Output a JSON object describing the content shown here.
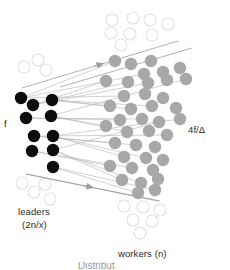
{
  "figure": {
    "labels": {
      "left_node_label": "f",
      "right_node_label": "4f/Δ",
      "leaders_label": "leaders",
      "leaders_sublabel": "(2n/x)",
      "workers_label": "workers (n)",
      "caption_partial": "Distribut"
    },
    "colors": {
      "leader_fill": "#0d0d0d",
      "worker_fill": "#a8a8a8",
      "ghost_stroke": "#e2e2e2",
      "edge_stroke": "#b4b4b4",
      "arrow_stroke": "#a0a0a0",
      "text": "#2b2b2b",
      "background": "#ffffff"
    }
  },
  "chart_data": {
    "type": "scatter",
    "xlabel": "",
    "ylabel": "",
    "xlim": [
      0,
      230
    ],
    "ylim": [
      0,
      270
    ],
    "grid": false,
    "legend": "none",
    "annotations": [
      {
        "text": "f",
        "x": 6,
        "y": 123
      },
      {
        "text": "4f/Δ",
        "x": 190,
        "y": 130
      },
      {
        "text": "leaders",
        "x": 20,
        "y": 212
      },
      {
        "text": "(2n/x)",
        "x": 24,
        "y": 225
      },
      {
        "text": "workers (n)",
        "x": 120,
        "y": 254
      }
    ],
    "series": [
      {
        "name": "leaders",
        "marker": "filled-circle",
        "color": "#0d0d0d",
        "radius": 6.2,
        "points": [
          [
            21,
            98
          ],
          [
            33,
            105
          ],
          [
            52,
            100
          ],
          [
            26,
            118
          ],
          [
            51,
            116
          ],
          [
            34,
            136
          ],
          [
            53,
            136
          ],
          [
            32,
            151
          ],
          [
            53,
            150
          ],
          [
            53,
            167
          ]
        ]
      },
      {
        "name": "workers",
        "marker": "filled-circle",
        "color": "#a8a8a8",
        "radius": 6.2,
        "points": [
          [
            115,
            61
          ],
          [
            131,
            64
          ],
          [
            151,
            61
          ],
          [
            144,
            74
          ],
          [
            163,
            72
          ],
          [
            180,
            68
          ],
          [
            106,
            81
          ],
          [
            128,
            82
          ],
          [
            148,
            83
          ],
          [
            167,
            80
          ],
          [
            186,
            79
          ],
          [
            124,
            96
          ],
          [
            145,
            94
          ],
          [
            163,
            98
          ],
          [
            110,
            106
          ],
          [
            131,
            109
          ],
          [
            152,
            106
          ],
          [
            176,
            108
          ],
          [
            120,
            120
          ],
          [
            142,
            119
          ],
          [
            159,
            122
          ],
          [
            180,
            119
          ],
          [
            106,
            126
          ],
          [
            127,
            132
          ],
          [
            149,
            131
          ],
          [
            167,
            135
          ],
          [
            115,
            143
          ],
          [
            136,
            145
          ],
          [
            155,
            147
          ],
          [
            124,
            157
          ],
          [
            146,
            158
          ],
          [
            163,
            160
          ],
          [
            110,
            166
          ],
          [
            132,
            168
          ],
          [
            153,
            170
          ],
          [
            122,
            180
          ],
          [
            141,
            183
          ],
          [
            158,
            179
          ],
          [
            138,
            193
          ],
          [
            155,
            190
          ]
        ]
      },
      {
        "name": "ghost-leaders",
        "marker": "open-circle",
        "color": "#e2e2e2",
        "radius": 6.0,
        "points": [
          [
            24,
            67
          ],
          [
            38,
            60
          ],
          [
            46,
            70
          ],
          [
            22,
            183
          ],
          [
            34,
            192
          ],
          [
            45,
            184
          ],
          [
            50,
            199
          ]
        ]
      },
      {
        "name": "ghost-workers",
        "marker": "open-circle",
        "color": "#e2e2e2",
        "radius": 6.0,
        "points": [
          [
            112,
            20
          ],
          [
            133,
            18
          ],
          [
            150,
            20
          ],
          [
            168,
            24
          ],
          [
            111,
            33
          ],
          [
            130,
            34
          ],
          [
            152,
            35
          ],
          [
            121,
            45
          ],
          [
            124,
            206
          ],
          [
            143,
            207
          ],
          [
            160,
            210
          ],
          [
            133,
            220
          ],
          [
            152,
            221
          ],
          [
            140,
            233
          ]
        ]
      }
    ],
    "edges": [
      [
        21,
        98,
        115,
        61
      ],
      [
        21,
        98,
        144,
        74
      ],
      [
        21,
        98,
        124,
        96
      ],
      [
        33,
        105,
        106,
        81
      ],
      [
        33,
        105,
        128,
        82
      ],
      [
        33,
        105,
        148,
        83
      ],
      [
        52,
        100,
        110,
        106
      ],
      [
        52,
        100,
        131,
        109
      ],
      [
        52,
        100,
        152,
        106
      ],
      [
        26,
        118,
        120,
        120
      ],
      [
        26,
        118,
        142,
        119
      ],
      [
        51,
        116,
        106,
        126
      ],
      [
        51,
        116,
        127,
        132
      ],
      [
        51,
        116,
        186,
        79
      ],
      [
        34,
        136,
        115,
        143
      ],
      [
        34,
        136,
        136,
        145
      ],
      [
        34,
        136,
        167,
        135
      ],
      [
        53,
        136,
        124,
        157
      ],
      [
        53,
        136,
        146,
        158
      ],
      [
        53,
        136,
        180,
        119
      ],
      [
        32,
        151,
        110,
        166
      ],
      [
        32,
        151,
        132,
        168
      ],
      [
        53,
        150,
        122,
        180
      ],
      [
        53,
        150,
        141,
        183
      ],
      [
        53,
        150,
        159,
        122
      ],
      [
        53,
        167,
        138,
        193
      ],
      [
        53,
        167,
        155,
        190
      ]
    ],
    "boundary_arrows": [
      {
        "x1": 22,
        "y1": 88,
        "x2": 178,
        "y2": 41,
        "arrow_at": 0.52
      },
      {
        "x1": 26,
        "y1": 174,
        "x2": 160,
        "y2": 201,
        "arrow_at": 0.5
      }
    ],
    "boundary_lines": [
      [
        60,
        87,
        192,
        48
      ],
      [
        26,
        174,
        158,
        201
      ]
    ]
  }
}
